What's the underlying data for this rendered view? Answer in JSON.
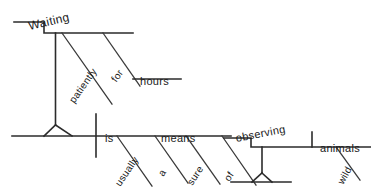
{
  "diagram": {
    "type": "reed-kellogg-sentence-diagram",
    "sentence": "Waiting patiently for hours is usually a sure means of observing wild animals.",
    "ink_color": "#2b2b2b",
    "background_color": "#ffffff",
    "words": {
      "waiting": "Waiting",
      "patiently": "patiently",
      "for": "for",
      "hours": "hours",
      "is": "is",
      "usually": "usually",
      "a": "a",
      "sure": "sure",
      "means": "means",
      "of": "of",
      "observing": "observing",
      "wild": "wild",
      "animals": "animals"
    },
    "roles": {
      "waiting": "gerund-subject",
      "patiently": "adverb-modifying-gerund",
      "for": "preposition",
      "hours": "object-of-preposition",
      "is": "linking-verb",
      "usually": "adverb-modifying-verb",
      "a": "article",
      "sure": "adjective",
      "means": "predicate-nominative",
      "of": "preposition",
      "observing": "gerund-object-of-preposition",
      "wild": "adjective",
      "animals": "direct-object-of-gerund"
    },
    "top_bleed_text": "."
  }
}
